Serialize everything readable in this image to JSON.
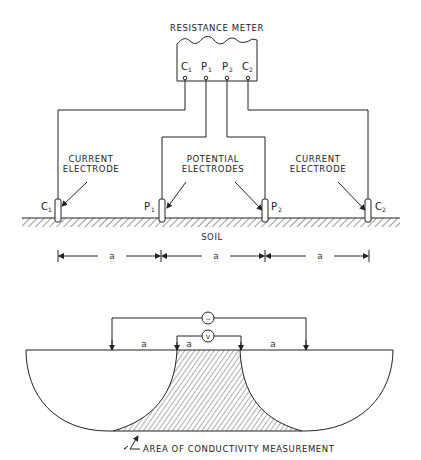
{
  "top_diagram": {
    "meter": {
      "title": "RESISTANCE METER",
      "terminals": [
        {
          "letter": "C",
          "sub": "1"
        },
        {
          "letter": "P",
          "sub": "1"
        },
        {
          "letter": "P",
          "sub": "2"
        },
        {
          "letter": "C",
          "sub": "2"
        }
      ]
    },
    "labels": {
      "current_left": [
        "CURRENT",
        "ELECTRODE"
      ],
      "potential": [
        "POTENTIAL",
        "ELECTRODES"
      ],
      "current_right": [
        "CURRENT",
        "ELECTRODE"
      ],
      "soil": "SOIL"
    },
    "electrodes": [
      {
        "letter": "C",
        "sub": "1"
      },
      {
        "letter": "P",
        "sub": "1"
      },
      {
        "letter": "P",
        "sub": "2"
      },
      {
        "letter": "C",
        "sub": "2"
      }
    ],
    "spacing_labels": [
      "a",
      "a",
      "a"
    ]
  },
  "bottom_diagram": {
    "source_symbol": "~",
    "voltmeter_symbol": "V",
    "spacing_labels": [
      "a",
      "a",
      "a"
    ],
    "caption": "AREA OF CONDUCTIVITY MEASUREMENT"
  }
}
